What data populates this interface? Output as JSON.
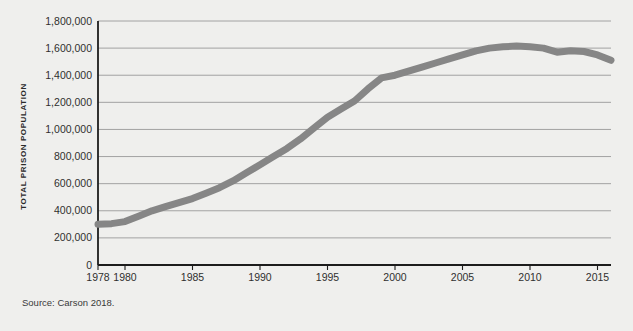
{
  "figure": {
    "source_note": "Source: Carson 2018.",
    "title_clipped": "",
    "background_color": "#efefed"
  },
  "chart_data": {
    "type": "line",
    "title": "",
    "xlabel": "",
    "ylabel": "TOTAL PRISON POPULATION",
    "xlim": [
      1978,
      2016
    ],
    "ylim": [
      0,
      1800000
    ],
    "grid": true,
    "legend": null,
    "line_color": "#868686",
    "line_width_px": 7,
    "xticks": [
      1978,
      1980,
      1985,
      1990,
      1995,
      2000,
      2005,
      2010,
      2015
    ],
    "xticklabels": [
      "1978",
      "1980",
      "1985",
      "1990",
      "1995",
      "2000",
      "2005",
      "2010",
      "2015"
    ],
    "yticks": [
      0,
      200000,
      400000,
      600000,
      800000,
      1000000,
      1200000,
      1400000,
      1600000,
      1800000
    ],
    "yticklabels": [
      "0",
      "200,000",
      "400,000",
      "600,000",
      "800,000",
      "1,000,000",
      "1,200,000",
      "1,400,000",
      "1,600,000",
      "1,800,000"
    ],
    "series": [
      {
        "name": "Total prison population",
        "x": [
          1978,
          1979,
          1980,
          1981,
          1982,
          1983,
          1984,
          1985,
          1986,
          1987,
          1988,
          1989,
          1990,
          1991,
          1992,
          1993,
          1994,
          1995,
          1996,
          1997,
          1998,
          1999,
          2000,
          2001,
          2002,
          2003,
          2004,
          2005,
          2006,
          2007,
          2008,
          2009,
          2010,
          2011,
          2012,
          2013,
          2014,
          2015,
          2016
        ],
        "values": [
          300000,
          305000,
          320000,
          360000,
          400000,
          430000,
          460000,
          490000,
          530000,
          570000,
          620000,
          680000,
          740000,
          800000,
          860000,
          930000,
          1010000,
          1090000,
          1150000,
          1210000,
          1300000,
          1380000,
          1400000,
          1430000,
          1460000,
          1490000,
          1520000,
          1550000,
          1580000,
          1600000,
          1610000,
          1615000,
          1610000,
          1600000,
          1570000,
          1580000,
          1575000,
          1550000,
          1510000
        ]
      }
    ]
  }
}
